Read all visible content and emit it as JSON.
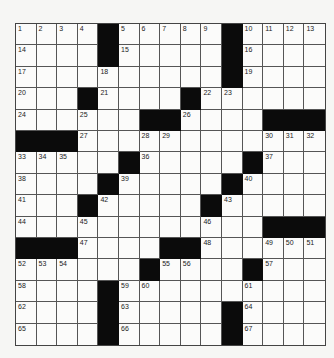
{
  "puzzle": {
    "size": {
      "rows": 15,
      "cols": 15
    },
    "colors": {
      "background": "#f6f6f4",
      "cell": "#fbfbfa",
      "block": "#0b0b0b",
      "line": "#555555"
    },
    "rows": [
      [
        "1",
        "2",
        "3",
        "4",
        "#",
        "5",
        "6",
        "7",
        "8",
        "9",
        "#",
        "10",
        "11",
        "12",
        "13"
      ],
      [
        "14",
        "",
        "",
        "",
        "#",
        "15",
        "",
        "",
        "",
        "",
        "#",
        "16",
        "",
        "",
        ""
      ],
      [
        "17",
        "",
        "",
        "",
        "18",
        "",
        "",
        "",
        "",
        "",
        "#",
        "19",
        "",
        "",
        ""
      ],
      [
        "20",
        "",
        "",
        "#",
        "21",
        "",
        "",
        "",
        "#",
        "22",
        "23",
        "",
        "",
        "",
        ""
      ],
      [
        "24",
        "",
        "",
        "25",
        "",
        "",
        "#",
        "#",
        "26",
        "",
        "",
        "",
        "#",
        "#",
        "#"
      ],
      [
        "#",
        "#",
        "#",
        "27",
        "",
        "",
        "28",
        "29",
        "",
        "",
        "",
        "",
        "30",
        "31",
        "32"
      ],
      [
        "33",
        "34",
        "35",
        "",
        "",
        "#",
        "36",
        "",
        "",
        "",
        "",
        "#",
        "37",
        "",
        ""
      ],
      [
        "38",
        "",
        "",
        "",
        "#",
        "39",
        "",
        "",
        "",
        "",
        "#",
        "40",
        "",
        "",
        ""
      ],
      [
        "41",
        "",
        "",
        "#",
        "42",
        "",
        "",
        "",
        "",
        "#",
        "43",
        "",
        "",
        "",
        ""
      ],
      [
        "44",
        "",
        "",
        "45",
        "",
        "",
        "",
        "",
        "",
        "46",
        "",
        "",
        "#",
        "#",
        "#"
      ],
      [
        "#",
        "#",
        "#",
        "47",
        "",
        "",
        "",
        "#",
        "#",
        "48",
        "",
        "",
        "49",
        "50",
        "51"
      ],
      [
        "52",
        "53",
        "54",
        "",
        "",
        "",
        "#",
        "55",
        "56",
        "",
        "",
        "#",
        "57",
        "",
        ""
      ],
      [
        "58",
        "",
        "",
        "",
        "#",
        "59",
        "60",
        "",
        "",
        "",
        "",
        "61",
        "",
        "",
        ""
      ],
      [
        "62",
        "",
        "",
        "",
        "#",
        "63",
        "",
        "",
        "",
        "",
        "#",
        "64",
        "",
        "",
        ""
      ],
      [
        "65",
        "",
        "",
        "",
        "#",
        "66",
        "",
        "",
        "",
        "",
        "#",
        "67",
        "",
        "",
        ""
      ]
    ]
  }
}
